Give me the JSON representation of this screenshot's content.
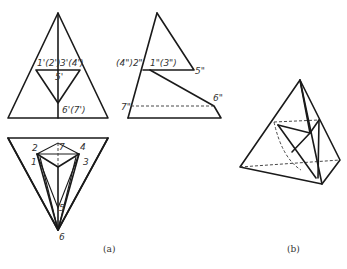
{
  "figure": {
    "front_view": {
      "labels": {
        "p12": "1'(2')",
        "p34": "3'(4')",
        "p5": "5'",
        "p67": "6'(7')"
      }
    },
    "side_view": {
      "labels": {
        "p42": "(4\")2\"",
        "p13": "1\"(3\")",
        "p5": "5\"",
        "p7": "7\"",
        "p6": "6\""
      }
    },
    "top_view": {
      "labels": {
        "p1": "1",
        "p2": "2",
        "p3": "3",
        "p4": "4",
        "p5": "5",
        "p6": "6",
        "p7": "7"
      }
    },
    "captions": {
      "a": "(a)",
      "b": "(b)"
    }
  }
}
